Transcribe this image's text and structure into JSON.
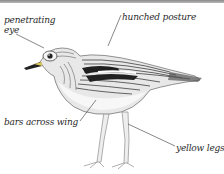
{
  "figure": {
    "top_rule_color": "#9a9a9a",
    "labels": [
      {
        "id": "eye",
        "lines": [
          "penetrating",
          "eye"
        ]
      },
      {
        "id": "posture",
        "text": "hunched posture"
      },
      {
        "id": "wing",
        "text": "bars across wing"
      },
      {
        "id": "legs",
        "text": "yellow legs"
      }
    ]
  }
}
